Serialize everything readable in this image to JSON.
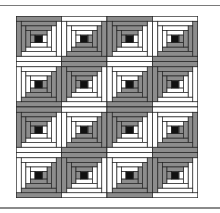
{
  "figure": {
    "grid_rows": 4,
    "grid_cols": 4,
    "rings_per_block": 4,
    "block_layout": [
      [
        "A",
        "B",
        "A",
        "B"
      ],
      [
        "B",
        "A",
        "B",
        "A"
      ],
      [
        "A",
        "B",
        "A",
        "B"
      ],
      [
        "B",
        "A",
        "B",
        "A"
      ]
    ],
    "block_types": {
      "A": {
        "dark_sides": [
          "top",
          "left"
        ],
        "light_sides": [
          "bottom",
          "right"
        ]
      },
      "B": {
        "dark_sides": [
          "bottom",
          "right"
        ],
        "light_sides": [
          "top",
          "left"
        ]
      }
    },
    "colors": {
      "dark": "#8c8c8c",
      "light": "#ffffff",
      "center": "#111111",
      "outline": "#222222"
    }
  }
}
